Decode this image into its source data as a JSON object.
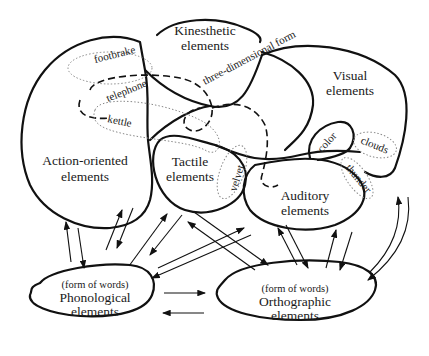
{
  "regions": {
    "kinesthetic": {
      "line1": "Kinesthetic",
      "line2": "elements"
    },
    "visual": {
      "line1": "Visual",
      "line2": "elements"
    },
    "action": {
      "line1": "Action-oriented",
      "line2": "elements"
    },
    "tactile": {
      "line1": "Tactile",
      "line2": "elements"
    },
    "auditory": {
      "line1": "Auditory",
      "line2": "elements"
    },
    "phonological": {
      "note": "(form of words)",
      "line1": "Phonological",
      "line2": "elements"
    },
    "orthographic": {
      "note": "(form of words)",
      "line1": "Orthographic",
      "line2": "elements"
    }
  },
  "features": {
    "footbrake": "footbrake",
    "telephone": "telephone",
    "kettle": "kettle",
    "three_dimensional_form": "three-dimensional form",
    "velvet": "velvet",
    "color": "color",
    "clouds": "clouds",
    "thunder": "thunder"
  }
}
